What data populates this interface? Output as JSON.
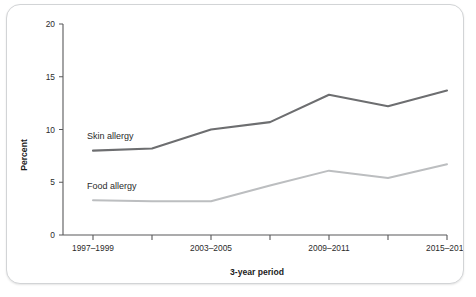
{
  "chart_data": {
    "type": "line",
    "title": "",
    "xlabel": "3-year period",
    "ylabel": "Percent",
    "categories": [
      "1997-1999",
      "2000-2002",
      "2003-2005",
      "2006-2008",
      "2009-2011",
      "2012-2014",
      "2015-2017"
    ],
    "tick_labels_visible": [
      "1997–1999",
      "",
      "2003–2005",
      "",
      "2009–2011",
      "",
      "2015–2017"
    ],
    "ylim": [
      0,
      20
    ],
    "yticks": [
      0,
      5,
      10,
      15,
      20
    ],
    "ytick_labels": [
      "0",
      "5",
      "10",
      "15",
      "20"
    ],
    "grid": false,
    "legend_position": "inline-annotation",
    "series": [
      {
        "name": "Skin allergy",
        "color": "#6d6e70",
        "values": [
          8.0,
          8.2,
          10.0,
          10.7,
          13.3,
          12.2,
          13.7
        ]
      },
      {
        "name": "Food allergy",
        "color": "#bcbec0",
        "values": [
          3.3,
          3.2,
          3.2,
          4.7,
          6.1,
          5.4,
          6.7
        ]
      }
    ],
    "annotations": [
      {
        "text": "Skin allergy",
        "series": "Skin allergy"
      },
      {
        "text": "Food allergy",
        "series": "Food allergy"
      }
    ]
  },
  "axis": {
    "x_title": "3-year period",
    "y_title": "Percent"
  }
}
